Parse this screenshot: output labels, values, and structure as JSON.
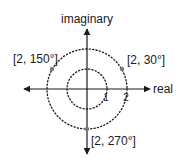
{
  "diagram": {
    "type": "complex-plane-polar",
    "axes": {
      "horizontal_label": "real",
      "vertical_label": "imaginary"
    },
    "circles": [
      {
        "radius": 1,
        "tick_label": "1"
      },
      {
        "radius": 2,
        "tick_label": "2"
      }
    ],
    "points": [
      {
        "r": 2,
        "angle_deg": 30,
        "label": "[2, 30°]"
      },
      {
        "r": 2,
        "angle_deg": 150,
        "label": "[2, 150°]"
      },
      {
        "r": 2,
        "angle_deg": 270,
        "label": "[2, 270°]"
      }
    ],
    "colors": {
      "line": "#1a1a1a",
      "point": "#7a7a7a",
      "background": "#ffffff"
    }
  }
}
